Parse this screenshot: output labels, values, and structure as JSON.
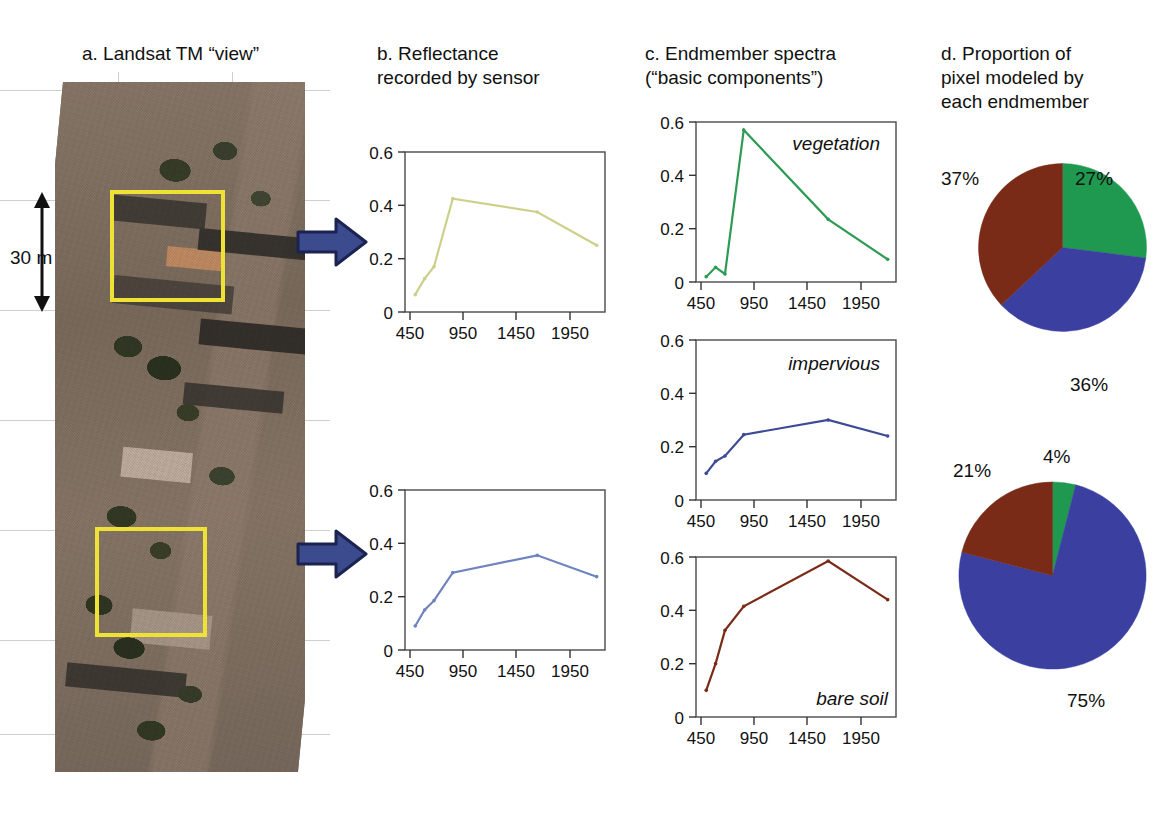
{
  "figure": {
    "panels": {
      "a": {
        "letter": "a.",
        "title": "a. Landsat TM “view”",
        "scale_label": "30 m",
        "scale_unit_italic": "m"
      },
      "b": {
        "letter": "b.",
        "title": "b. Reflectance\nrecorded by sensor"
      },
      "c": {
        "letter": "c.",
        "title": "c. Endmember spectra\n(“basic components”)"
      },
      "d": {
        "letter": "d.",
        "title": "d. Proportion of\npixel modeled by\neach endmember"
      }
    }
  },
  "colors": {
    "vegetation_green": "#2e9b55",
    "pixel1_line": "#cdd08a",
    "pixel2_line": "#6f83c0",
    "impervious_blue": "#3d4a96",
    "bare_soil_brown": "#7a2b18",
    "pie_green": "#1f9950",
    "pie_blue": "#3b3fa0",
    "pie_brown": "#7a2b18",
    "arrow_fill": "#3c4a8e",
    "box_yellow": "#eee234"
  },
  "chart_data": [
    {
      "id": "pixel-1-reflectance",
      "panel": "b",
      "type": "line",
      "title": "",
      "xlabel": "",
      "ylabel": "",
      "x": [
        480,
        570,
        660,
        840,
        1650,
        2220
      ],
      "xticks": [
        450,
        950,
        1450,
        1950
      ],
      "yticks": [
        0,
        0.2,
        0.4,
        0.6
      ],
      "xlim": [
        430,
        2300
      ],
      "ylim": [
        0,
        0.6
      ],
      "grid": false,
      "series": [
        {
          "name": "pixel 1 reflectance",
          "color": "#cdd08a",
          "values": [
            0.065,
            0.125,
            0.17,
            0.425,
            0.375,
            0.25
          ]
        }
      ]
    },
    {
      "id": "pixel-2-reflectance",
      "panel": "b",
      "type": "line",
      "title": "",
      "xlabel": "",
      "ylabel": "",
      "x": [
        480,
        570,
        660,
        840,
        1650,
        2220
      ],
      "xticks": [
        450,
        950,
        1450,
        1950
      ],
      "yticks": [
        0,
        0.2,
        0.4,
        0.6
      ],
      "xlim": [
        430,
        2300
      ],
      "ylim": [
        0,
        0.6
      ],
      "grid": false,
      "series": [
        {
          "name": "pixel 2 reflectance",
          "color": "#6f83c0",
          "values": [
            0.09,
            0.15,
            0.185,
            0.29,
            0.355,
            0.275
          ]
        }
      ]
    },
    {
      "id": "endmember-vegetation",
      "panel": "c",
      "type": "line",
      "title": "vegetation",
      "xlabel": "",
      "ylabel": "",
      "x": [
        480,
        570,
        660,
        840,
        1650,
        2220
      ],
      "xticks": [
        450,
        950,
        1450,
        1950
      ],
      "yticks": [
        0,
        0.2,
        0.4,
        0.6
      ],
      "xlim": [
        430,
        2300
      ],
      "ylim": [
        0,
        0.6
      ],
      "grid": false,
      "series": [
        {
          "name": "vegetation",
          "color": "#2e9b55",
          "values": [
            0.02,
            0.055,
            0.03,
            0.57,
            0.235,
            0.085
          ]
        }
      ]
    },
    {
      "id": "endmember-impervious",
      "panel": "c",
      "type": "line",
      "title": "impervious",
      "xlabel": "",
      "ylabel": "",
      "x": [
        480,
        570,
        660,
        840,
        1650,
        2220
      ],
      "xticks": [
        450,
        950,
        1450,
        1950
      ],
      "yticks": [
        0,
        0.2,
        0.4,
        0.6
      ],
      "xlim": [
        430,
        2300
      ],
      "ylim": [
        0,
        0.6
      ],
      "grid": false,
      "series": [
        {
          "name": "impervious",
          "color": "#3d4a96",
          "values": [
            0.1,
            0.145,
            0.165,
            0.245,
            0.3,
            0.24
          ]
        }
      ]
    },
    {
      "id": "endmember-bare-soil",
      "panel": "c",
      "type": "line",
      "title": "bare soil",
      "xlabel": "",
      "ylabel": "",
      "x": [
        480,
        570,
        660,
        840,
        1650,
        2220
      ],
      "xticks": [
        450,
        950,
        1450,
        1950
      ],
      "yticks": [
        0,
        0.2,
        0.4,
        0.6
      ],
      "xlim": [
        430,
        2300
      ],
      "ylim": [
        0,
        0.6
      ],
      "grid": false,
      "series": [
        {
          "name": "bare soil",
          "color": "#7a2b18",
          "values": [
            0.1,
            0.2,
            0.325,
            0.415,
            0.585,
            0.44
          ]
        }
      ]
    },
    {
      "id": "pixel-1-proportions",
      "panel": "d",
      "type": "pie",
      "title": "",
      "labels": [
        "27%",
        "36%",
        "37%"
      ],
      "categories": [
        "vegetation",
        "impervious",
        "bare soil"
      ],
      "values": [
        27,
        36,
        37
      ],
      "colors": [
        "#1f9950",
        "#3b3fa0",
        "#7a2b18"
      ]
    },
    {
      "id": "pixel-2-proportions",
      "panel": "d",
      "type": "pie",
      "title": "",
      "labels": [
        "4%",
        "75%",
        "21%"
      ],
      "categories": [
        "vegetation",
        "impervious",
        "bare soil"
      ],
      "values": [
        4,
        75,
        21
      ],
      "colors": [
        "#1f9950",
        "#3b3fa0",
        "#7a2b18"
      ]
    }
  ],
  "charts": {
    "pixel1": {
      "xticks": [
        "450",
        "950",
        "1450",
        "1950"
      ],
      "yticks": [
        "0.6",
        "0.4",
        "0.2",
        "0"
      ]
    },
    "pixel2": {
      "xticks": [
        "450",
        "950",
        "1450",
        "1950"
      ],
      "yticks": [
        "0.6",
        "0.4",
        "0.2",
        "0"
      ]
    },
    "vegetation": {
      "label": "vegetation",
      "xticks": [
        "450",
        "950",
        "1450",
        "1950"
      ],
      "yticks": [
        "0.6",
        "0.4",
        "0.2",
        "0"
      ]
    },
    "impervious": {
      "label": "impervious",
      "xticks": [
        "450",
        "950",
        "1450",
        "1950"
      ],
      "yticks": [
        "0.6",
        "0.4",
        "0.2",
        "0"
      ]
    },
    "baresoil": {
      "label": "bare soil",
      "xticks": [
        "450",
        "950",
        "1450",
        "1950"
      ],
      "yticks": [
        "0.6",
        "0.4",
        "0.2",
        "0"
      ]
    }
  },
  "pies": {
    "top": {
      "veg": "27%",
      "imp": "36%",
      "soil": "37%"
    },
    "bottom": {
      "veg": "4%",
      "imp": "75%",
      "soil": "21%"
    }
  }
}
